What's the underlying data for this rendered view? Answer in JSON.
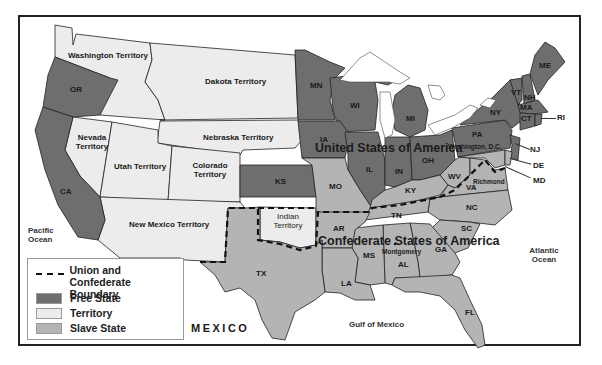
{
  "map": {
    "regions": {
      "washington_territory": "Washington Territory",
      "dakota_territory": "Dakota Territory",
      "nebraska_territory": "Nebraska Territory",
      "nevada_territory": "Nevada Territory",
      "utah_territory": "Utah Territory",
      "colorado_territory": "Colorado Territory",
      "new_mexico_territory": "New Mexico Territory",
      "indian_territory": "Indian Territory"
    },
    "free_states": [
      "OR",
      "CA",
      "KS",
      "MN",
      "WI",
      "IA",
      "IL",
      "IN",
      "MI",
      "OH",
      "PA",
      "NY",
      "VT",
      "NH",
      "ME",
      "MA",
      "CT",
      "RI",
      "NJ"
    ],
    "slave_states": [
      "MO",
      "KY",
      "WV",
      "MD",
      "DE",
      "VA",
      "NC",
      "SC",
      "GA",
      "FL",
      "AL",
      "MS",
      "TN",
      "AR",
      "LA",
      "TX"
    ],
    "labels": {
      "OR": "OR",
      "CA": "CA",
      "KS": "KS",
      "MN": "MN",
      "WI": "WI",
      "IA": "IA",
      "IL": "IL",
      "IN": "IN",
      "MI": "MI",
      "OH": "OH",
      "PA": "PA",
      "NY": "NY",
      "VT": "VT",
      "NH": "NH",
      "ME": "ME",
      "MA": "MA",
      "CT": "CT",
      "RI": "RI",
      "NJ": "NJ",
      "DE": "DE",
      "MD": "MD",
      "WV": "WV",
      "VA": "VA",
      "MO": "MO",
      "KY": "KY",
      "TN": "TN",
      "NC": "NC",
      "SC": "SC",
      "GA": "GA",
      "AL": "AL",
      "MS": "MS",
      "AR": "AR",
      "LA": "LA",
      "TX": "TX",
      "FL": "FL"
    },
    "cities": {
      "washington_dc": "Washington, D.C.",
      "richmond": "Richmond",
      "montgomery": "Montgomery"
    },
    "nations": {
      "union": "United States of America",
      "confederacy": "Confederate States of America",
      "mexico": "MEXICO"
    },
    "water": {
      "pacific": "Pacific Ocean",
      "atlantic": "Atlantic Ocean",
      "gulf": "Gulf of Mexico"
    },
    "colors": {
      "free_state": "#6e6e6e",
      "territory": "#ececec",
      "slave_state": "#b4b4b4",
      "boundary": "#111111",
      "frame": "#222222"
    }
  },
  "legend": {
    "boundary": "Union and Confederate Boundary",
    "boundary_line1": "Union and Confederate",
    "boundary_line2": "Boundary",
    "free_state": "Free State",
    "territory": "Territory",
    "slave_state": "Slave State"
  }
}
